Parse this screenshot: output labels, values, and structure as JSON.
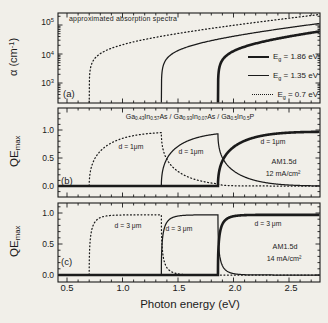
{
  "figure": {
    "background": "#f1efe9",
    "ink": "#1b1b1b",
    "x_axis": {
      "label": "Photon energy (eV)",
      "tick_labels": [
        "0.5",
        "1.0",
        "1.5",
        "2.0",
        "2.5"
      ],
      "tick_values": [
        0.5,
        1.0,
        1.5,
        2.0,
        2.5
      ],
      "minor_step_eV": 0.1,
      "range_eV": [
        0.419,
        2.779
      ]
    },
    "model": {
      "description": "approximated absorption model used for all panels",
      "alpha0_cm": 30000,
      "exp_decades_per_eV": 0.35,
      "collection_efficiency": 0.97,
      "band_gaps_eV": {
        "top": 1.86,
        "middle": 1.35,
        "bottom": 0.7
      }
    }
  },
  "chart_data": [
    {
      "panel": "a",
      "type": "line",
      "yscale": "log",
      "panel_label": "(a)",
      "title": "approximated absorption spectra",
      "ylabel_segments": [
        {
          "t": "α (cm"
        },
        {
          "p": "-1"
        },
        {
          "t": ")"
        }
      ],
      "y_ticks": [
        {
          "value": 100000,
          "segments": [
            {
              "t": "10"
            },
            {
              "p": "5"
            }
          ]
        },
        {
          "value": 10000,
          "segments": [
            {
              "t": "10"
            },
            {
              "p": "4"
            }
          ]
        },
        {
          "value": 1000,
          "segments": [
            {
              "t": "10"
            },
            {
              "p": "3"
            }
          ]
        }
      ],
      "y_range_cm": [
        204,
        260000
      ],
      "series": [
        {
          "name": "Eg = 1.86 eV",
          "Eg_eV": 1.86,
          "style": "thick",
          "legend_segments": [
            {
              "t": "E"
            },
            {
              "s": "g"
            },
            {
              "t": " = 1.86 eV"
            }
          ]
        },
        {
          "name": "Eg = 1.35 eV",
          "Eg_eV": 1.35,
          "style": "thin",
          "legend_segments": [
            {
              "t": "E"
            },
            {
              "s": "g"
            },
            {
              "t": " = 1.35 eV"
            }
          ]
        },
        {
          "name": "Eg = 0.7 eV",
          "Eg_eV": 0.7,
          "style": "dotted",
          "legend_segments": [
            {
              "t": "E"
            },
            {
              "s": "g"
            },
            {
              "t": " = 0.7 eV"
            }
          ]
        }
      ]
    },
    {
      "panel": "b",
      "type": "line",
      "yscale": "linear",
      "panel_label": "(b)",
      "stack_segments": [
        {
          "t": "Ga"
        },
        {
          "s": "0.43"
        },
        {
          "t": "In"
        },
        {
          "s": "0.57"
        },
        {
          "t": "As"
        },
        {
          "t": " / Ga"
        },
        {
          "s": "0.93"
        },
        {
          "t": "In"
        },
        {
          "s": "0.07"
        },
        {
          "t": "As"
        },
        {
          "t": " / Ga"
        },
        {
          "s": "0.5"
        },
        {
          "t": "In"
        },
        {
          "s": "0.5"
        },
        {
          "t": "P"
        }
      ],
      "ylabel_segments": [
        {
          "t": "QE"
        },
        {
          "s": "max"
        }
      ],
      "y_tick_labels": [
        "1.0",
        "0.5",
        "0.0"
      ],
      "y_tick_values": [
        1.0,
        0.5,
        0.0
      ],
      "thickness_um": 1,
      "curve_labels": [
        "d = 1μm",
        "d = 1μm",
        "d = 1μm"
      ],
      "annotation_lines": [
        "AM1.5d",
        "12 mA/cm²"
      ],
      "series": [
        {
          "cell": "bottom",
          "Eg_eV": 0.7,
          "style": "dotted"
        },
        {
          "cell": "middle",
          "Eg_eV": 1.35,
          "style": "thin"
        },
        {
          "cell": "top",
          "Eg_eV": 1.86,
          "style": "thick"
        }
      ]
    },
    {
      "panel": "c",
      "type": "line",
      "yscale": "linear",
      "panel_label": "(c)",
      "ylabel_segments": [
        {
          "t": "QE"
        },
        {
          "s": "max"
        }
      ],
      "y_tick_labels": [
        "1.0",
        "0.5",
        "0.0"
      ],
      "y_tick_values": [
        1.0,
        0.5,
        0.0
      ],
      "thickness_um": 3,
      "curve_labels": [
        "d = 3 μm",
        "d = 3 μm",
        "d = 3 μm"
      ],
      "annotation_lines": [
        "AM1.5d",
        "14 mA/cm²"
      ],
      "series": [
        {
          "cell": "bottom",
          "Eg_eV": 0.7,
          "style": "dotted"
        },
        {
          "cell": "middle",
          "Eg_eV": 1.35,
          "style": "thin"
        },
        {
          "cell": "top",
          "Eg_eV": 1.86,
          "style": "thick"
        }
      ]
    }
  ]
}
